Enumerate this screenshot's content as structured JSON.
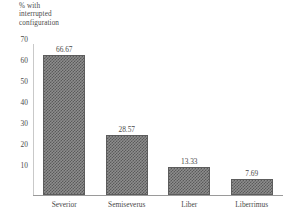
{
  "chart_data": {
    "type": "bar",
    "title": "% with\ninterrupted\nconfiguration",
    "subtitle": "",
    "xlabel": "",
    "ylabel": "",
    "categories": [
      "Severior",
      "Semiseverus",
      "Liber",
      "Liberrimus"
    ],
    "values": [
      66.67,
      28.57,
      13.33,
      7.69
    ],
    "value_labels": [
      "66.67",
      "28.57",
      "13.33",
      "7.69"
    ],
    "yticks": [
      70,
      60,
      50,
      40,
      30,
      20,
      10
    ],
    "ytick_labels": [
      "70",
      "60",
      "50",
      "40",
      "30",
      "20",
      "10"
    ],
    "ylim": [
      0,
      72
    ],
    "grid": false,
    "legend": false,
    "legend_position": "none",
    "colors": {
      "bar_fill": "#8d8d8d",
      "bar_pattern": "#5a5a5a",
      "bar_edge": "#5d5d5d",
      "axis": "#9a9a9a",
      "text": "#4a4a4a",
      "background": "#ffffff"
    }
  }
}
